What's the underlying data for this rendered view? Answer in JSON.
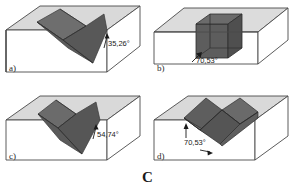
{
  "figure": {
    "caption": "C",
    "panels": [
      {
        "id": "a",
        "letter": "a)",
        "angle_label": "35,26°",
        "shape": "v-groove-wedge"
      },
      {
        "id": "b",
        "letter": "b)",
        "angle_label": "70,53°",
        "shape": "embedded-prism"
      },
      {
        "id": "c",
        "letter": "c)",
        "angle_label": "54,74°",
        "shape": "v-groove-wedge-steep"
      },
      {
        "id": "d",
        "letter": "d)",
        "angle_label": "70,53°",
        "shape": "zigzag-groove"
      }
    ]
  },
  "colors": {
    "block_top": "#d9d9d9",
    "block_front": "#ffffff",
    "block_side": "#ffffff",
    "outline": "#4a4a4a",
    "wedge_dark": "#585858",
    "wedge_mid": "#6e6e6e",
    "wedge_light": "#7d7d7d",
    "text": "#1a1a1a",
    "background": "#ffffff"
  }
}
